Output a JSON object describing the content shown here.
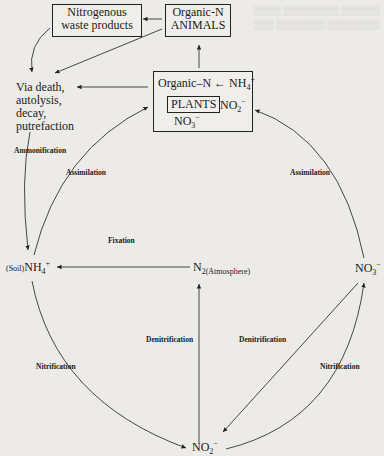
{
  "nodes": {
    "waste": {
      "line1": "Nitrogenous",
      "line2": "waste products"
    },
    "animals": {
      "line1": "Organic-N",
      "line2": "ANIMALS"
    },
    "death": {
      "line1": "Via death,",
      "line2": "autolysis,",
      "line3": "decay,",
      "line4": "putrefaction"
    },
    "plants": {
      "organic_n": "Organic–N ← NH",
      "nh4_sub": "4",
      "nh4_sup": "+",
      "plants_label": "PLANTS",
      "no2": "NO",
      "no2_sub": "2",
      "no2_sup": "−",
      "no3": "NO",
      "no3_sub": "3",
      "no3_sup": "−"
    },
    "soil_nh4": {
      "prefix": "(Soil)",
      "main": "NH",
      "sub": "4",
      "sup": "+"
    },
    "n2": {
      "main": "N",
      "sub": "2(Atmosphere)"
    },
    "no3_right": {
      "main": "NO",
      "sub": "3",
      "sup": "−"
    },
    "no2_bottom": {
      "main": "NO",
      "sub": "2",
      "sup": "−"
    }
  },
  "processes": {
    "ammonification": "Ammonification",
    "assimilation_left": "Assimilation",
    "assimilation_right": "Assimilation",
    "fixation": "Fixation",
    "denitrification_left": "Denitrification",
    "denitrification_right": "Denitrification",
    "nitrification_left": "Nitrification",
    "nitrification_right": "Nitrification"
  }
}
